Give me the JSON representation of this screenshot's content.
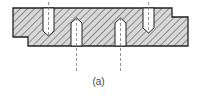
{
  "figure": {
    "caption": "(a)",
    "colors": {
      "outline": "#222222",
      "hatch": "#555555",
      "fill": "#d8d8d8",
      "centerline": "#777777",
      "hole": "#ffffff"
    },
    "holes": [
      {
        "id": "hole-1",
        "entry": "top"
      },
      {
        "id": "hole-2",
        "entry": "bottom"
      },
      {
        "id": "hole-3",
        "entry": "bottom"
      },
      {
        "id": "hole-4",
        "entry": "top"
      }
    ]
  }
}
